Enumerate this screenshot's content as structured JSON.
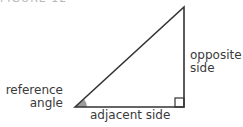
{
  "header": {
    "clipped_text": "FIGURE 12"
  },
  "diagram": {
    "labels": {
      "opposite_line1": "opposite",
      "opposite_line2": "side",
      "reference_line1": "reference",
      "reference_line2": "angle",
      "adjacent": "adjacent side"
    },
    "colors": {
      "stroke": "#333333",
      "angle_fill": "#8a8a8a",
      "text": "#3a3a3a"
    }
  }
}
